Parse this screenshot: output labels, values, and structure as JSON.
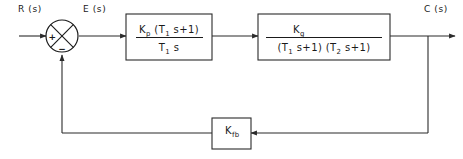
{
  "diagram": {
    "type": "control-system-block-diagram",
    "colors": {
      "background": "#ffffff",
      "line": "#2b2b2b",
      "text": "#1a1a1a"
    },
    "signals": {
      "input_label": "R (s)",
      "error_label": "E (s)",
      "output_label": "C (s)"
    },
    "summing_junction": {
      "name": "summing-junction",
      "style": "circle-with-cross",
      "input_sign": "+",
      "feedback_sign": "−"
    },
    "controller_block": {
      "name": "controller-block",
      "numerator_main": "K",
      "numerator_sub": "p",
      "numerator_rest_a": " (T",
      "numerator_rest_sub": "1",
      "numerator_rest_b": " s+1)",
      "denominator_main": "T",
      "denominator_sub": "1",
      "denominator_rest": " s"
    },
    "plant_block": {
      "name": "plant-block",
      "numerator_main": "K",
      "numerator_sub": "g",
      "denominator_a": "(T",
      "denominator_a_sub": "1",
      "denominator_a_rest": " s+1)",
      "denominator_b": "  (T",
      "denominator_b_sub": "2",
      "denominator_b_rest": " s+1)"
    },
    "feedback_block": {
      "name": "feedback-block",
      "main": "K",
      "sub": "fb"
    }
  }
}
